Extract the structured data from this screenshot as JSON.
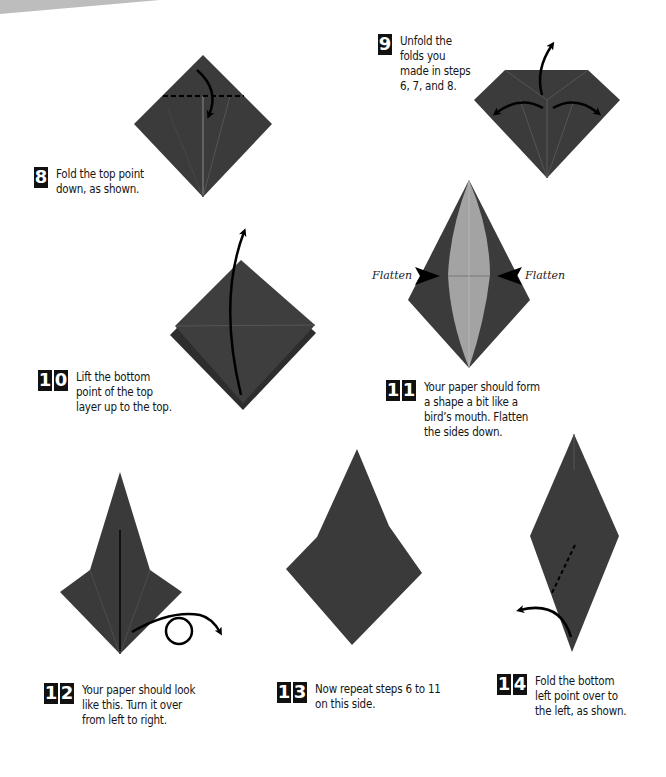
{
  "colors": {
    "paper": "#3c3c3c",
    "paper_dark": "#2e2e2e",
    "paper_light": "#9a9a9a",
    "crease": "#5a5a5a",
    "arrow": "#000000",
    "background": "#ffffff"
  },
  "steps": [
    {
      "number": "8",
      "text": "Fold the top point\ndown, as shown."
    },
    {
      "number": "9",
      "text": "Unfold the\nfolds you\nmade in steps\n6, 7, and 8."
    },
    {
      "number": "10",
      "text": "Lift the bottom\npoint of the top\nlayer up to the top."
    },
    {
      "number": "11",
      "text": "Your paper should form\na shape a bit like a\nbird’s mouth. Flatten\nthe sides down."
    },
    {
      "number": "12",
      "text": "Your paper should look\nlike this. Turn it over\nfrom left to right."
    },
    {
      "number": "13",
      "text": "Now repeat steps 6 to 11\non this side."
    },
    {
      "number": "14",
      "text": "Fold the bottom\nleft point over to\nthe left, as shown."
    }
  ],
  "labels": {
    "flatten_left": "Flatten",
    "flatten_right": "Flatten"
  },
  "icons": {
    "fold_arrow": "curved-arrow",
    "flatten_marker": "triangle-pointer",
    "turn_over": "loop-arrow"
  }
}
